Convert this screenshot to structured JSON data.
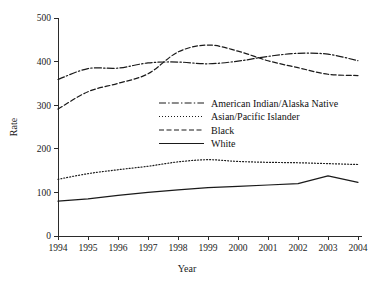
{
  "chart_data": {
    "type": "line",
    "title": "",
    "xlabel": "Year",
    "ylabel": "Rate",
    "grid": false,
    "legend_position": "center",
    "x": [
      1994,
      1995,
      1996,
      1997,
      1998,
      1999,
      2000,
      2001,
      2002,
      2003,
      2004
    ],
    "xtick_labels": [
      "1994",
      "1995",
      "1996",
      "1997",
      "1998",
      "1999",
      "2000",
      "2001",
      "2002",
      "2003",
      "2004"
    ],
    "ytick_labels": [
      "0",
      "100",
      "200",
      "300",
      "400",
      "500"
    ],
    "ytick_values": [
      0,
      100,
      200,
      300,
      400,
      500
    ],
    "xlim": [
      1994,
      2004
    ],
    "ylim": [
      0,
      500
    ],
    "series": [
      {
        "name": "American Indian/Alaska Native",
        "style": "dash-dot",
        "color": "#1a1a1a",
        "values": [
          359,
          384,
          385,
          397,
          399,
          395,
          401,
          412,
          419,
          417,
          402
        ]
      },
      {
        "name": "Asian/Pacific Islander",
        "style": "dotted",
        "color": "#1a1a1a",
        "values": [
          130,
          143,
          152,
          160,
          170,
          175,
          171,
          169,
          168,
          166,
          164
        ]
      },
      {
        "name": "Black",
        "style": "dashed",
        "color": "#1a1a1a",
        "values": [
          291,
          331,
          350,
          372,
          422,
          438,
          424,
          402,
          386,
          371,
          368
        ]
      },
      {
        "name": "White",
        "style": "solid",
        "color": "#1a1a1a",
        "values": [
          80,
          85,
          93,
          100,
          106,
          111,
          114,
          117,
          120,
          138,
          123
        ]
      }
    ]
  },
  "legend": {
    "entries": [
      {
        "label": "American Indian/Alaska Native",
        "style": "dash-dot"
      },
      {
        "label": "Asian/Pacific Islander",
        "style": "dotted"
      },
      {
        "label": "Black",
        "style": "dashed"
      },
      {
        "label": "White",
        "style": "solid"
      }
    ]
  },
  "axes": {
    "y_title": "Rate",
    "x_title": "Year"
  }
}
